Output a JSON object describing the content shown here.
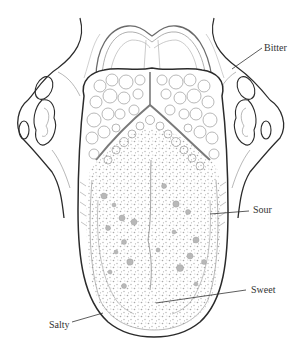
{
  "diagram": {
    "colors": {
      "outline": "#2b2b2b",
      "fine_line": "#9a9a9a",
      "papilla_fill": "#b8b8b8",
      "dot": "#a8a8a8",
      "leader": "#333333",
      "text": "#333333",
      "background": "#ffffff"
    },
    "labels": [
      {
        "id": "bitter",
        "text": "Bitter",
        "x": 264,
        "y": 43,
        "line": [
          262,
          48,
          232,
          69
        ]
      },
      {
        "id": "sour",
        "text": "Sour",
        "x": 253,
        "y": 205,
        "line": [
          249,
          211,
          210,
          214
        ]
      },
      {
        "id": "sweet",
        "text": "Sweet",
        "x": 251,
        "y": 285,
        "line": [
          246,
          290,
          156,
          303
        ]
      },
      {
        "id": "salty",
        "text": "Salty",
        "x": 49,
        "y": 320,
        "line": [
          72,
          322,
          103,
          313
        ]
      }
    ]
  }
}
